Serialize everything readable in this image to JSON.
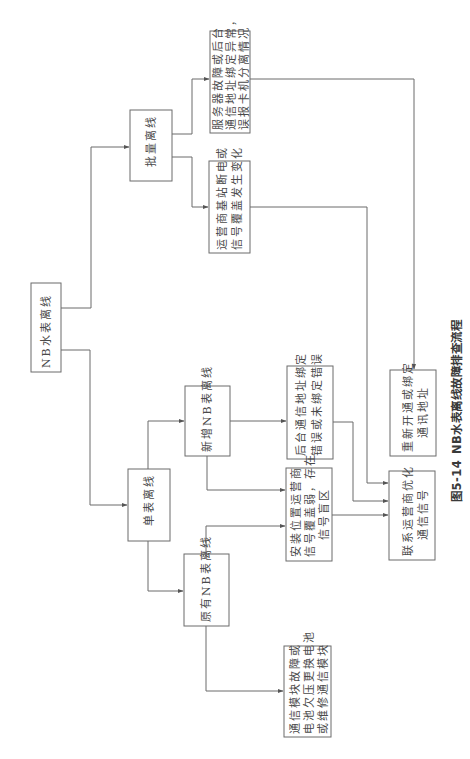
{
  "figure": {
    "caption_number": "图5-14",
    "caption_title": "NB水表离线故障排查流程",
    "orientation": "rotated 90° counter-clockwise",
    "line_color": "#6b6b6b",
    "text_color": "#4a4a4a"
  },
  "nodes": {
    "root": {
      "lines": [
        "NB水表离线"
      ]
    },
    "batch": {
      "lines": [
        "批量离线"
      ]
    },
    "server_fault": {
      "lines": [
        "服务器故障或后台",
        "通信地址绑定异常，",
        "误报卡机分离情况"
      ]
    },
    "carrier_outage": {
      "lines": [
        "运营商基站断电或",
        "信号覆盖发生变化"
      ]
    },
    "single": {
      "lines": [
        "单表离线"
      ]
    },
    "new_meter": {
      "lines": [
        "新增NB表离线"
      ]
    },
    "binding_error": {
      "lines": [
        "后台通信地址绑定",
        "错误或未绑定错误"
      ]
    },
    "weak_signal": {
      "lines": [
        "安装位置运营商",
        "信号覆盖弱，存在",
        "信号盲区"
      ]
    },
    "old_meter": {
      "lines": [
        "原有NB表离线"
      ]
    },
    "module_fault": {
      "lines": [
        "通信模块故障或",
        "电池欠压更换电池",
        "或维修通信模块"
      ]
    },
    "rebind": {
      "lines": [
        "重新开通或绑定",
        "通讯地址"
      ]
    },
    "contact_carrier": {
      "lines": [
        "联系运营商优化",
        "通信信号"
      ]
    }
  },
  "edges": [
    {
      "from": "root",
      "to": "batch"
    },
    {
      "from": "root",
      "to": "single"
    },
    {
      "from": "batch",
      "to": "server_fault"
    },
    {
      "from": "batch",
      "to": "carrier_outage"
    },
    {
      "from": "server_fault",
      "to": "rebind"
    },
    {
      "from": "carrier_outage",
      "to": "contact_carrier"
    },
    {
      "from": "single",
      "to": "new_meter"
    },
    {
      "from": "single",
      "to": "old_meter"
    },
    {
      "from": "new_meter",
      "to": "binding_error"
    },
    {
      "from": "new_meter",
      "to": "weak_signal"
    },
    {
      "from": "old_meter",
      "to": "weak_signal"
    },
    {
      "from": "old_meter",
      "to": "module_fault"
    },
    {
      "from": "binding_error",
      "to": "contact_carrier"
    },
    {
      "from": "weak_signal",
      "to": "contact_carrier"
    }
  ]
}
